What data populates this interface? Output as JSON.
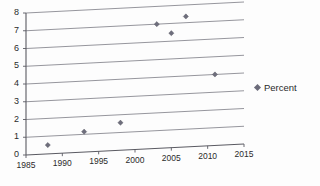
{
  "chart_data": {
    "type": "scatter",
    "title": "",
    "subtitle": "",
    "xlabel": "",
    "ylabel": "",
    "xlim": [
      1985,
      2015
    ],
    "ylim": [
      0,
      8
    ],
    "grid": true,
    "legend_position": "right",
    "series": [
      {
        "name": "Percent",
        "marker": "diamond",
        "color": "#6e6e7c",
        "points": [
          {
            "x": 1988,
            "y": 0.5
          },
          {
            "x": 1993,
            "y": 1.15
          },
          {
            "x": 1998,
            "y": 1.55
          },
          {
            "x": 2003,
            "y": 7.0
          },
          {
            "x": 2005,
            "y": 6.45
          },
          {
            "x": 2007,
            "y": 7.35
          },
          {
            "x": 2011,
            "y": 4.0
          }
        ]
      }
    ],
    "x_ticks": [
      1985,
      1990,
      1995,
      2000,
      2005,
      2010,
      2015
    ],
    "x_tick_labels": [
      "1985",
      "1990",
      "1995",
      "2000",
      "2005",
      "2010",
      "2015"
    ],
    "y_ticks": [
      0,
      1,
      2,
      3,
      4,
      5,
      6,
      7,
      8
    ],
    "y_tick_labels": [
      "0",
      "1",
      "2",
      "3",
      "4",
      "5",
      "6",
      "7",
      "8"
    ]
  },
  "legend": {
    "entries": [
      {
        "label": "Percent",
        "marker_color": "#6e6e7c"
      }
    ]
  },
  "colors": {
    "marker": "#6e6e7c",
    "gridline": "#8a8a92",
    "axis": "#5a5a62",
    "text": "#2b2b2b",
    "background": "#fdfdfd"
  }
}
